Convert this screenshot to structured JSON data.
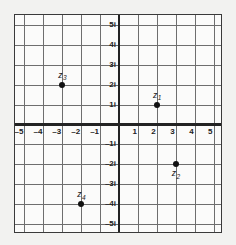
{
  "chart_data": {
    "type": "scatter",
    "title": "",
    "xlabel": "",
    "ylabel": "",
    "xlim": [
      -5.5,
      5.5
    ],
    "ylim": [
      -5.5,
      5.5
    ],
    "grid": true,
    "legend": false,
    "x_ticks": [
      {
        "value": -5,
        "label": "–5"
      },
      {
        "value": -4,
        "label": "–4"
      },
      {
        "value": -3,
        "label": "–3"
      },
      {
        "value": -2,
        "label": "–2"
      },
      {
        "value": -1,
        "label": "–1"
      },
      {
        "value": 1,
        "label": "1"
      },
      {
        "value": 2,
        "label": "2"
      },
      {
        "value": 3,
        "label": "3"
      },
      {
        "value": 4,
        "label": "4"
      },
      {
        "value": 5,
        "label": "5"
      }
    ],
    "y_ticks": [
      {
        "value": 5,
        "label": "5i"
      },
      {
        "value": 4,
        "label": "4i"
      },
      {
        "value": 3,
        "label": "3i"
      },
      {
        "value": 2,
        "label": "2i"
      },
      {
        "value": 1,
        "label": "1i"
      },
      {
        "value": -1,
        "label": "–1i"
      },
      {
        "value": -2,
        "label": "–2i"
      },
      {
        "value": -3,
        "label": "–3i"
      },
      {
        "value": -4,
        "label": "–4i"
      },
      {
        "value": -5,
        "label": "–5i"
      }
    ],
    "points": [
      {
        "name": "z",
        "sub": "1",
        "x": 2,
        "y": 1,
        "label_position": "above"
      },
      {
        "name": "z",
        "sub": "2",
        "x": 3,
        "y": -2,
        "label_position": "below"
      },
      {
        "name": "z",
        "sub": "3",
        "x": -3,
        "y": 2,
        "label_position": "above"
      },
      {
        "name": "z",
        "sub": "4",
        "x": -2,
        "y": -4,
        "label_position": "above"
      }
    ],
    "colors": {
      "background": "#f2f2f0",
      "plot_background": "#fbfbfa",
      "gridline": "#6e6e6e",
      "axis": "#232323",
      "point": "#111111",
      "text": "#222222"
    }
  }
}
